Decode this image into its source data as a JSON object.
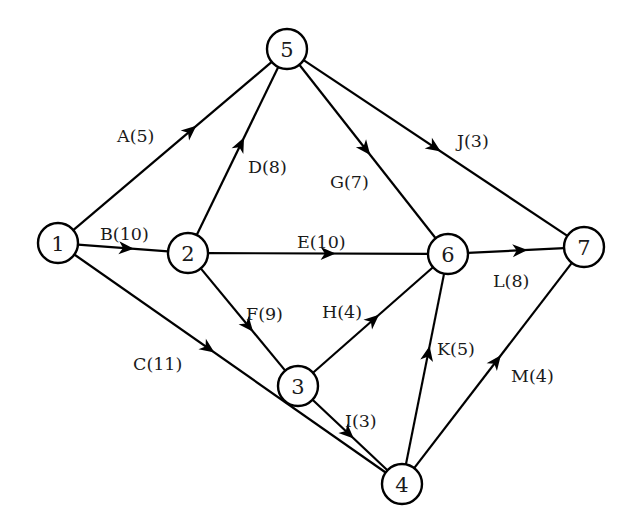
{
  "diagram": {
    "type": "activity-on-arrow project network",
    "colors": {
      "background": "#ffffff",
      "stroke": "#000000",
      "text": "#1a1a1a"
    },
    "nodes": [
      {
        "id": "1",
        "label": "1",
        "x": 58,
        "y": 243
      },
      {
        "id": "2",
        "label": "2",
        "x": 188,
        "y": 253
      },
      {
        "id": "3",
        "label": "3",
        "x": 298,
        "y": 386
      },
      {
        "id": "4",
        "label": "4",
        "x": 402,
        "y": 484
      },
      {
        "id": "5",
        "label": "5",
        "x": 287,
        "y": 49
      },
      {
        "id": "6",
        "label": "6",
        "x": 448,
        "y": 254
      },
      {
        "id": "7",
        "label": "7",
        "x": 584,
        "y": 247
      }
    ],
    "edges": [
      {
        "activity": "A",
        "duration": 5,
        "label": "A(5)",
        "from": "1",
        "to": "5",
        "arrow_t": 0.62,
        "label_x": 117,
        "label_y": 142
      },
      {
        "activity": "B",
        "duration": 10,
        "label": "B(10)",
        "from": "1",
        "to": "2",
        "arrow_t": 0.62,
        "label_x": 100,
        "label_y": 240
      },
      {
        "activity": "C",
        "duration": 11,
        "label": "C(11)",
        "from": "1",
        "to": "4",
        "arrow_t": 0.45,
        "label_x": 133,
        "label_y": 370
      },
      {
        "activity": "D",
        "duration": 8,
        "label": "D(8)",
        "from": "2",
        "to": "5",
        "arrow_t": 0.58,
        "label_x": 248,
        "label_y": 173
      },
      {
        "activity": "E",
        "duration": 10,
        "label": "E(10)",
        "from": "2",
        "to": "6",
        "arrow_t": 0.58,
        "label_x": 297,
        "label_y": 248
      },
      {
        "activity": "F",
        "duration": 9,
        "label": "F(9)",
        "from": "2",
        "to": "3",
        "arrow_t": 0.62,
        "label_x": 246,
        "label_y": 320
      },
      {
        "activity": "G",
        "duration": 7,
        "label": "G(7)",
        "from": "5",
        "to": "6",
        "arrow_t": 0.52,
        "label_x": 330,
        "label_y": 188
      },
      {
        "activity": "H",
        "duration": 4,
        "label": "H(4)",
        "from": "3",
        "to": "6",
        "arrow_t": 0.55,
        "label_x": 322,
        "label_y": 318
      },
      {
        "activity": "I",
        "duration": 3,
        "label": "I(3)",
        "from": "3",
        "to": "4",
        "arrow_t": 0.55,
        "label_x": 345,
        "label_y": 427
      },
      {
        "activity": "J",
        "duration": 3,
        "label": "J(3)",
        "from": "5",
        "to": "7",
        "arrow_t": 0.52,
        "label_x": 457,
        "label_y": 147
      },
      {
        "activity": "K",
        "duration": 5,
        "label": "K(5)",
        "from": "4",
        "to": "6",
        "arrow_t": 0.62,
        "label_x": 437,
        "label_y": 355
      },
      {
        "activity": "L",
        "duration": 8,
        "label": "L(8)",
        "from": "6",
        "to": "7",
        "arrow_t": 0.62,
        "label_x": 493,
        "label_y": 287
      },
      {
        "activity": "M",
        "duration": 4,
        "label": "M(4)",
        "from": "4",
        "to": "7",
        "arrow_t": 0.55,
        "label_x": 511,
        "label_y": 382
      }
    ]
  }
}
